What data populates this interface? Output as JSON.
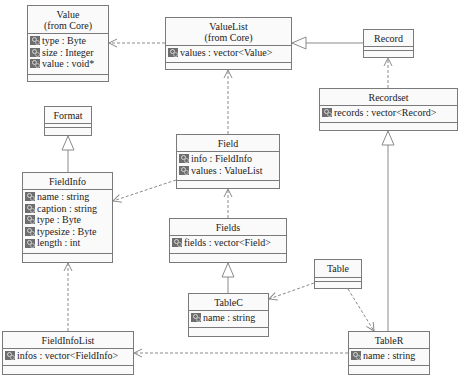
{
  "diagram": {
    "type": "uml-class-diagram",
    "colors": {
      "box_border": "#7a7a7a",
      "box_fill": "#fafafa",
      "icon": "#6e6e6e",
      "edge": "#8a8a8a",
      "text": "#222222"
    }
  },
  "classes": {
    "value": {
      "name": "Value\n(from Core)",
      "attributes": [
        "type : Byte",
        "size : Integer",
        "value : void*"
      ]
    },
    "valuelist": {
      "name": "ValueList\n(from Core)",
      "attributes": [
        "values : vector<Value>"
      ]
    },
    "record": {
      "name": "Record",
      "attributes": []
    },
    "recordset": {
      "name": "Recordset",
      "attributes": [
        "records : vector<Record>"
      ]
    },
    "format": {
      "name": "Format",
      "attributes": []
    },
    "field": {
      "name": "Field",
      "attributes": [
        "info : FieldInfo",
        "values : ValueList"
      ]
    },
    "fieldinfo": {
      "name": "FieldInfo",
      "attributes": [
        "name : string",
        "caption : string",
        "type : Byte",
        "typesize : Byte",
        "length : int"
      ]
    },
    "fields": {
      "name": "Fields",
      "attributes": [
        "fields : vector<Field>"
      ]
    },
    "table": {
      "name": "Table",
      "attributes": []
    },
    "tablec": {
      "name": "TableC",
      "attributes": [
        "name : string"
      ]
    },
    "fieldinfolist": {
      "name": "FieldInfoList",
      "attributes": [
        "infos : vector<FieldInfo>"
      ]
    },
    "tabler": {
      "name": "TableR",
      "attributes": [
        "name : string"
      ]
    }
  },
  "relationships": [
    {
      "from": "ValueList",
      "to": "Value",
      "kind": "dependency"
    },
    {
      "from": "Record",
      "to": "ValueList",
      "kind": "generalization"
    },
    {
      "from": "Recordset",
      "to": "Record",
      "kind": "dependency"
    },
    {
      "from": "FieldInfo",
      "to": "Format",
      "kind": "generalization"
    },
    {
      "from": "Field",
      "to": "ValueList",
      "kind": "dependency"
    },
    {
      "from": "Field",
      "to": "FieldInfo",
      "kind": "dependency"
    },
    {
      "from": "Fields",
      "to": "Field",
      "kind": "dependency"
    },
    {
      "from": "TableC",
      "to": "Fields",
      "kind": "generalization"
    },
    {
      "from": "Table",
      "to": "TableC",
      "kind": "dependency"
    },
    {
      "from": "Table",
      "to": "TableR",
      "kind": "dependency"
    },
    {
      "from": "TableR",
      "to": "Recordset",
      "kind": "generalization"
    },
    {
      "from": "FieldInfoList",
      "to": "FieldInfo",
      "kind": "dependency"
    },
    {
      "from": "TableR",
      "to": "FieldInfoList",
      "kind": "dependency"
    }
  ]
}
